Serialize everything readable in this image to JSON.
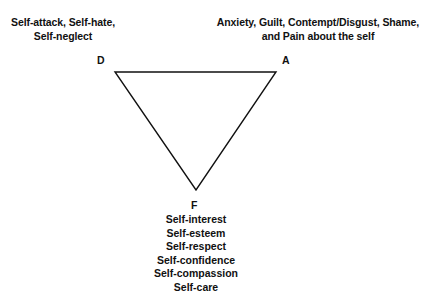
{
  "diagram": {
    "type": "triangle-of-conflict",
    "vertices": {
      "D": {
        "label": "D",
        "description": [
          "Self-attack, Self-hate,",
          "Self-neglect"
        ]
      },
      "A": {
        "label": "A",
        "description": [
          "Anxiety, Guilt, Contempt/Disgust, Shame,",
          "and Pain about the self"
        ]
      },
      "F": {
        "label": "F",
        "items": [
          "Self-interest",
          "Self-esteem",
          "Self-respect",
          "Self-confidence",
          "Self-compassion",
          "Self-care"
        ]
      }
    },
    "colors": {
      "line": "#111111",
      "text": "#111111",
      "background": "#ffffff"
    }
  }
}
